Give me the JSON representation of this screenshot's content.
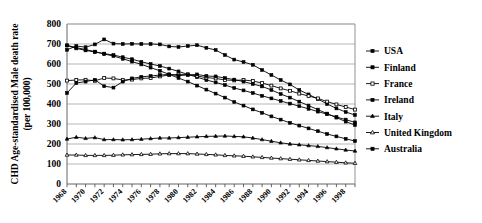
{
  "chart_data": {
    "type": "line",
    "title": "",
    "xlabel": "",
    "ylabel": "CHD Age-standardised Male death rate (per 100,000)",
    "ylim": [
      0,
      800
    ],
    "ytick_step": 100,
    "yticks": [
      "0",
      "100",
      "200",
      "300",
      "400",
      "500",
      "600",
      "700",
      "800"
    ],
    "xlim": [
      1968,
      1999
    ],
    "xticks": [
      "1968",
      "1970",
      "1972",
      "1974",
      "1976",
      "1978",
      "1980",
      "1982",
      "1984",
      "1986",
      "1988",
      "1990",
      "1992",
      "1994",
      "1996",
      "1998"
    ],
    "x": [
      1968,
      1969,
      1970,
      1971,
      1972,
      1973,
      1974,
      1975,
      1976,
      1977,
      1978,
      1979,
      1980,
      1981,
      1982,
      1983,
      1984,
      1985,
      1986,
      1987,
      1988,
      1989,
      1990,
      1991,
      1992,
      1993,
      1994,
      1995,
      1996,
      1997,
      1998,
      1999
    ],
    "grid": true,
    "legend_position": "right",
    "series": [
      {
        "name": "USA",
        "marker": "filled-square",
        "values": [
          693,
          678,
          668,
          660,
          652,
          645,
          634,
          624,
          611,
          600,
          590,
          577,
          563,
          548,
          534,
          520,
          508,
          495,
          480,
          468,
          455,
          441,
          428,
          415,
          402,
          389,
          376,
          362,
          349,
          335,
          322,
          308
        ]
      },
      {
        "name": "Finland",
        "marker": "filled-square",
        "values": [
          671,
          690,
          684,
          698,
          723,
          702,
          700,
          701,
          700,
          700,
          698,
          688,
          685,
          690,
          694,
          681,
          670,
          645,
          622,
          610,
          596,
          570,
          545,
          520,
          498,
          470,
          448,
          425,
          400,
          378,
          360,
          345
        ]
      },
      {
        "name": "France",
        "marker": "open-square",
        "values": [
          517,
          520,
          521,
          516,
          530,
          528,
          520,
          522,
          528,
          530,
          538,
          545,
          548,
          548,
          540,
          532,
          528,
          520,
          518,
          520,
          515,
          505,
          492,
          478,
          466,
          452,
          440,
          428,
          412,
          398,
          385,
          372
        ]
      },
      {
        "name": "Ireland",
        "marker": "filled-square",
        "values": [
          455,
          505,
          512,
          521,
          489,
          482,
          512,
          528,
          536,
          540,
          545,
          548,
          542,
          545,
          548,
          540,
          538,
          530,
          522,
          512,
          500,
          488,
          470,
          450,
          432,
          412,
          392,
          372,
          352,
          332,
          312,
          295
        ]
      },
      {
        "name": "Italy",
        "marker": "filled-triangle",
        "values": [
          225,
          234,
          228,
          232,
          222,
          222,
          221,
          222,
          224,
          227,
          230,
          230,
          232,
          234,
          236,
          238,
          239,
          240,
          238,
          236,
          230,
          222,
          214,
          206,
          200,
          196,
          192,
          188,
          182,
          176,
          170,
          165
        ]
      },
      {
        "name": "United Kingdom",
        "marker": "open-triangle",
        "values": [
          145,
          145,
          143,
          143,
          143,
          144,
          146,
          147,
          148,
          149,
          151,
          152,
          152,
          152,
          150,
          148,
          146,
          143,
          141,
          139,
          136,
          133,
          130,
          127,
          124,
          121,
          118,
          115,
          112,
          109,
          106,
          104
        ]
      },
      {
        "name": "Australia",
        "marker": "filled-square",
        "values": [
          693,
          682,
          672,
          662,
          650,
          640,
          626,
          612,
          598,
          582,
          566,
          548,
          530,
          512,
          492,
          472,
          452,
          432,
          410,
          392,
          373,
          356,
          338,
          322,
          306,
          292,
          278,
          264,
          250,
          238,
          226,
          215
        ]
      }
    ]
  },
  "legend": {
    "items": [
      {
        "label": "USA"
      },
      {
        "label": "Finland"
      },
      {
        "label": "France"
      },
      {
        "label": "Ireland"
      },
      {
        "label": "Italy"
      },
      {
        "label": "United Kingdom"
      },
      {
        "label": "Australia"
      }
    ]
  }
}
